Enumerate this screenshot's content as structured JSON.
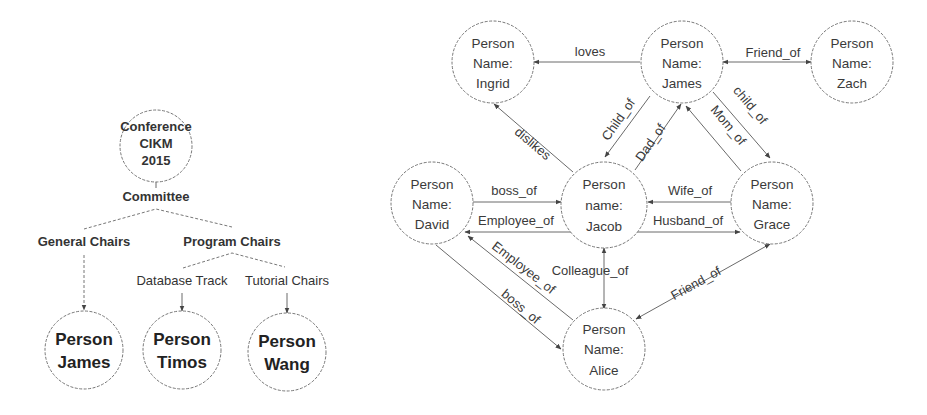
{
  "left_tree": {
    "root": {
      "line1": "Conference",
      "line2": "CIKM",
      "line3": "2015"
    },
    "committee": "Committee",
    "general_chairs": "General Chairs",
    "program_chairs": "Program Chairs",
    "database_track": "Database Track",
    "tutorial_chairs": "Tutorial Chairs",
    "leaves": [
      {
        "line1": "Person",
        "line2": "James"
      },
      {
        "line1": "Person",
        "line2": "Timos"
      },
      {
        "line1": "Person",
        "line2": "Wang"
      }
    ]
  },
  "graph": {
    "nodes": {
      "ingrid": {
        "line1": "Person",
        "line2": "Name:",
        "line3": "Ingrid"
      },
      "james": {
        "line1": "Person",
        "line2": "Name:",
        "line3": "James"
      },
      "zach": {
        "line1": "Person",
        "line2": "Name:",
        "line3": "Zach"
      },
      "david": {
        "line1": "Person",
        "line2": "Name:",
        "line3": "David"
      },
      "jacob": {
        "line1": "Person",
        "line2": "name:",
        "line3": "Jacob"
      },
      "grace": {
        "line1": "Person",
        "line2": "Name:",
        "line3": "Grace"
      },
      "alice": {
        "line1": "Person",
        "line2": "Name:",
        "line3": "Alice"
      }
    },
    "edges": {
      "loves": "loves",
      "friend_of_zach": "Friend_of",
      "dislikes": "dislikes",
      "child_of_jacob": "Child_of",
      "dad_of": "Dad_of",
      "mom_of": "Mom_of",
      "child_of_grace": "child_of",
      "boss_of_david_jacob": "boss_of",
      "employee_of_jacob_david": "Employee_of",
      "wife_of": "Wife_of",
      "husband_of": "Husband_of",
      "employee_of_alice_david": "Employee_of",
      "boss_of_david_alice": "boss_of",
      "colleague_of": "Colleague_of",
      "friend_of_alice": "Friend_of"
    }
  }
}
